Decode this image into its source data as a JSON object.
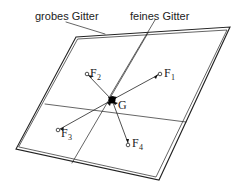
{
  "labels": {
    "coarse_grid": "grobes Gitter",
    "fine_grid": "feines Gitter",
    "center": "G"
  },
  "points": [
    {
      "name": "F",
      "sub": "1"
    },
    {
      "name": "F",
      "sub": "2"
    },
    {
      "name": "F",
      "sub": "3"
    },
    {
      "name": "F",
      "sub": "4"
    }
  ],
  "colors": {
    "line": "#222222",
    "background": "#ffffff"
  }
}
